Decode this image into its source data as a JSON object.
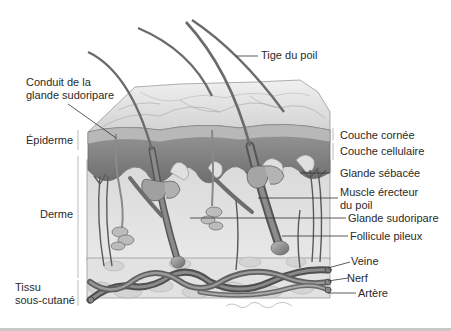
{
  "figure": {
    "signature": "A. Vogel / Bowman",
    "labels": {
      "tige_du_poil": "Tige du poil",
      "conduit_glande_line1": "Conduit de la",
      "conduit_glande_line2": "glande sudoripare",
      "epiderme": "Épiderme",
      "derme": "Derme",
      "tissu_line1": "Tissu",
      "tissu_line2": "sous-cutané",
      "couche_cornee": "Couche cornée",
      "couche_cellulaire": "Couche cellulaire",
      "glande_sebacee": "Glande sébacée",
      "muscle_line1": "Muscle érecteur",
      "muscle_line2": "du poil",
      "glande_sudoripare": "Glande sudoripare",
      "follicule_pileux": "Follicule pileux",
      "veine": "Veine",
      "nerf": "Nerf",
      "artere": "Artère"
    },
    "colors": {
      "background": "#ffffff",
      "ink": "#2a2a2a",
      "surface": "#e6e6e6",
      "epidermis": "#8a8a8a",
      "dermis": "#dcdcdc",
      "hair": "#6b6b6b",
      "vessel": "#5a5a5a"
    }
  }
}
